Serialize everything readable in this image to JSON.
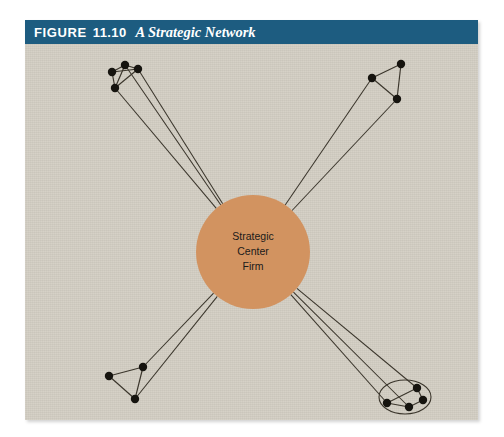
{
  "figure": {
    "label": "FIGURE",
    "number": "11.10",
    "caption": "A Strategic Network",
    "title_bar_color": "#1d5c80",
    "panel_color": "#d3cec3",
    "page_background": "#ffffff"
  },
  "center": {
    "name": "strategic-center-firm",
    "line1": "Strategic",
    "line2": "Center",
    "line3": "Firm",
    "fill_color": "#d29360",
    "cx": 228,
    "cy": 208,
    "r": 57
  },
  "diagram": {
    "type": "network",
    "node_color": "#16140f",
    "edge_color": "#3a352b",
    "node_radius": 4.2,
    "bundle_line_count": 3,
    "clusters": [
      {
        "name": "cluster-top-left",
        "nodes": [
          {
            "id": "tl1",
            "x": 87,
            "y": 28
          },
          {
            "id": "tl2",
            "x": 100,
            "y": 21
          },
          {
            "id": "tl3",
            "x": 113,
            "y": 25
          },
          {
            "id": "tl4",
            "x": 90,
            "y": 44
          }
        ],
        "edges": [
          [
            "tl1",
            "tl2"
          ],
          [
            "tl2",
            "tl3"
          ],
          [
            "tl1",
            "tl3"
          ],
          [
            "tl1",
            "tl4"
          ],
          [
            "tl2",
            "tl4"
          ],
          [
            "tl3",
            "tl4"
          ]
        ],
        "spokes": [
          "tl2",
          "tl3",
          "tl4"
        ],
        "enclosed": false
      },
      {
        "name": "cluster-top-right",
        "nodes": [
          {
            "id": "tr1",
            "x": 347,
            "y": 34
          },
          {
            "id": "tr2",
            "x": 376,
            "y": 20
          },
          {
            "id": "tr3",
            "x": 372,
            "y": 55
          }
        ],
        "edges": [
          [
            "tr1",
            "tr2"
          ],
          [
            "tr2",
            "tr3"
          ],
          [
            "tr1",
            "tr3"
          ]
        ],
        "spokes": [
          "tr1",
          "tr3"
        ],
        "enclosed": false
      },
      {
        "name": "cluster-bottom-left",
        "nodes": [
          {
            "id": "bl1",
            "x": 84,
            "y": 332
          },
          {
            "id": "bl2",
            "x": 118,
            "y": 323
          },
          {
            "id": "bl3",
            "x": 110,
            "y": 355
          }
        ],
        "edges": [
          [
            "bl1",
            "bl2"
          ],
          [
            "bl2",
            "bl3"
          ],
          [
            "bl1",
            "bl3"
          ]
        ],
        "spokes": [
          "bl2",
          "bl3"
        ],
        "enclosed": false
      },
      {
        "name": "cluster-bottom-right",
        "nodes": [
          {
            "id": "br1",
            "x": 362,
            "y": 359
          },
          {
            "id": "br2",
            "x": 384,
            "y": 363
          },
          {
            "id": "br3",
            "x": 392,
            "y": 344
          },
          {
            "id": "br4",
            "x": 398,
            "y": 356
          }
        ],
        "edges": [
          [
            "br1",
            "br2"
          ],
          [
            "br2",
            "br4"
          ],
          [
            "br3",
            "br4"
          ],
          [
            "br1",
            "br3"
          ]
        ],
        "spokes": [
          "br1",
          "br2",
          "br3"
        ],
        "enclosed": true,
        "ellipse": {
          "cx": 380,
          "cy": 353,
          "rx": 26,
          "ry": 17
        }
      }
    ]
  }
}
